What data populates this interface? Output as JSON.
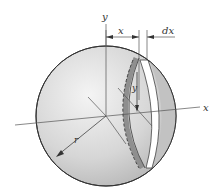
{
  "figure": {
    "labels": {
      "y_axis": "y",
      "x_axis": "x",
      "x_dim": "x",
      "dx_dim": "dx",
      "slice_y": "y",
      "radius": "r"
    },
    "colors": {
      "sphere_light": "#f2f2f2",
      "sphere_dark": "#b8b8b8",
      "slice_band": "#8f8f8f",
      "strip": "#ffffff",
      "outline": "#333333",
      "axis": "#555555"
    }
  }
}
